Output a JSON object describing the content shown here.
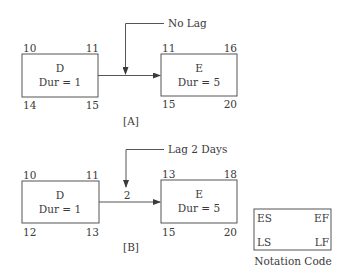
{
  "diagrams": [
    {
      "label": "[A]",
      "callout": "No Lag",
      "lag_value": "",
      "predecessor": {
        "name": "D",
        "duration": "Dur = 1",
        "es": "10",
        "ef": "11",
        "ls": "14",
        "lf": "15"
      },
      "successor": {
        "name": "E",
        "duration": "Dur = 5",
        "es": "11",
        "ef": "16",
        "ls": "15",
        "lf": "20"
      }
    },
    {
      "label": "[B]",
      "callout": "Lag 2 Days",
      "lag_value": "2",
      "predecessor": {
        "name": "D",
        "duration": "Dur = 1",
        "es": "10",
        "ef": "11",
        "ls": "12",
        "lf": "13"
      },
      "successor": {
        "name": "E",
        "duration": "Dur = 5",
        "es": "13",
        "ef": "18",
        "ls": "15",
        "lf": "20"
      }
    }
  ],
  "legend": {
    "title": "Notation Code",
    "es": "ES",
    "ef": "EF",
    "ls": "LS",
    "lf": "LF"
  },
  "colors": {
    "line": "#4a4a4a",
    "text": "#3a3a3a",
    "background": "#ffffff"
  }
}
